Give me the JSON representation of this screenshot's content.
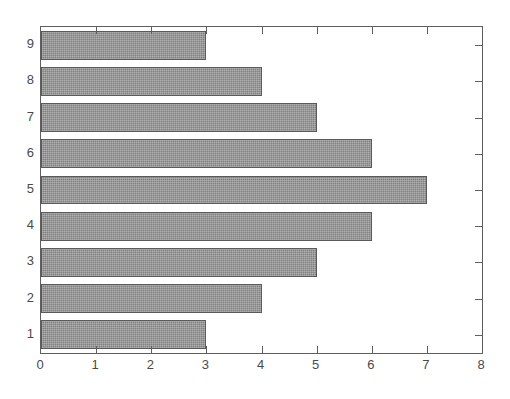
{
  "chart_data": {
    "type": "bar",
    "orientation": "horizontal",
    "title": "",
    "xlabel": "",
    "ylabel": "",
    "categories": [
      "1",
      "2",
      "3",
      "4",
      "5",
      "6",
      "7",
      "8",
      "9"
    ],
    "values": [
      3,
      4,
      5,
      6,
      7,
      6,
      5,
      4,
      3
    ],
    "xlim": [
      0,
      8
    ],
    "xticks": [
      0,
      1,
      2,
      3,
      4,
      5,
      6,
      7,
      8
    ],
    "xtick_labels": [
      "0",
      "1",
      "2",
      "3",
      "4",
      "5",
      "6",
      "7",
      "8"
    ],
    "ytick_labels": [
      "1",
      "2",
      "3",
      "4",
      "5",
      "6",
      "7",
      "8",
      "9"
    ],
    "grid": false,
    "legend": null,
    "bar_color": "#808080",
    "bar_edge_color": "#5a5a5a",
    "frame_color": "#5e5e5e",
    "background_color": "#ffffff"
  }
}
